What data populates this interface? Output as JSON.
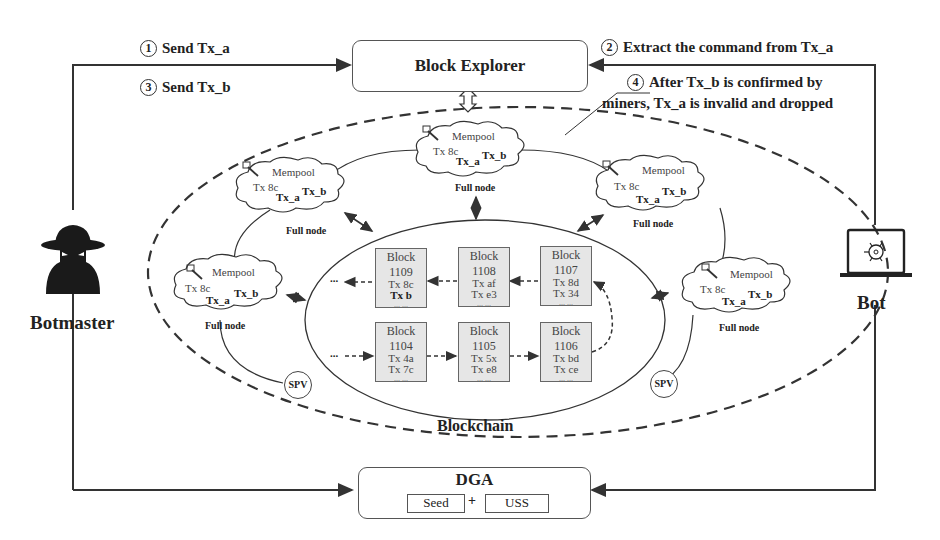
{
  "steps": {
    "step1": {
      "num": "1",
      "label": "Send Tx_a"
    },
    "step2": {
      "num": "2",
      "label": "Extract the command from Tx_a"
    },
    "step3": {
      "num": "3",
      "label": "Send Tx_b"
    },
    "step4": {
      "num": "4",
      "line1": "After Tx_b is confirmed by",
      "line2": "miners, Tx_a is invalid and dropped"
    }
  },
  "block_explorer": {
    "label": "Block Explorer"
  },
  "actors": {
    "botmaster": {
      "label": "Botmaster",
      "icon": "spy-icon"
    },
    "bot": {
      "label": "Bot",
      "icon": "laptop-bug-icon"
    }
  },
  "full_nodes": [
    {
      "mempool": "Mempool",
      "tx1": "Tx 8c",
      "tx2": "Tx_a",
      "tx3": "Tx_b",
      "label": "Full node"
    },
    {
      "mempool": "Mempool",
      "tx1": "Tx 8c",
      "tx2": "Tx_a",
      "tx3": "Tx_b",
      "label": "Full node"
    },
    {
      "mempool": "Mempool",
      "tx1": "Tx 8c",
      "tx2": "Tx_a",
      "tx3": "Tx_b",
      "label": "Full node"
    },
    {
      "mempool": "Mempool",
      "tx1": "Tx 8c",
      "tx2": "Tx_a",
      "tx3": "Tx_b",
      "label": "Full node"
    },
    {
      "mempool": "Mempool",
      "tx1": "Tx 8c",
      "tx2": "Tx_a",
      "tx3": "Tx_b",
      "label": "Full node"
    }
  ],
  "spv_nodes": [
    {
      "label": "SPV"
    },
    {
      "label": "SPV"
    }
  ],
  "blocks": [
    {
      "title": "Block",
      "num": "1109",
      "tx1": "Tx 8c",
      "tx2": "Tx b",
      "dots": "... ..."
    },
    {
      "title": "Block",
      "num": "1108",
      "tx1": "Tx af",
      "tx2": "Tx e3",
      "dots": "... ..."
    },
    {
      "title": "Block",
      "num": "1107",
      "tx1": "Tx 8d",
      "tx2": "Tx 34",
      "dots": "... ..."
    },
    {
      "title": "Block",
      "num": "1104",
      "tx1": "Tx 4a",
      "tx2": "Tx 7c",
      "dots": "... ..."
    },
    {
      "title": "Block",
      "num": "1105",
      "tx1": "Tx 5x",
      "tx2": "Tx e8",
      "dots": "... ..."
    },
    {
      "title": "Block",
      "num": "1106",
      "tx1": "Tx bd",
      "tx2": "Tx ce",
      "dots": "... ..."
    }
  ],
  "blockchain": {
    "label": "Blockchain",
    "ellipsis": "..."
  },
  "dga": {
    "label": "DGA",
    "seed": "Seed",
    "plus": "+",
    "uss": "USS"
  }
}
